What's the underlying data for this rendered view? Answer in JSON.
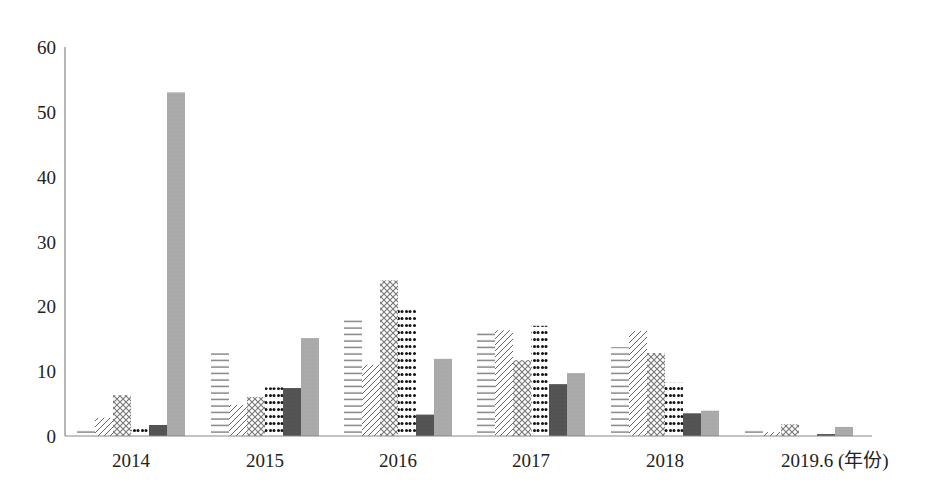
{
  "chart_data": {
    "type": "bar",
    "title": "",
    "xlabel": "(年份)",
    "ylabel": "",
    "ylim": [
      0,
      60
    ],
    "yticks": [
      0,
      10,
      20,
      30,
      40,
      50,
      60
    ],
    "grid": false,
    "legend_position": "bottom (cut off)",
    "categories": [
      "2014",
      "2015",
      "2016",
      "2017",
      "2018",
      "2019.6"
    ],
    "category_labels": [
      "2014",
      "2015",
      "2016",
      "2017",
      "2018",
      "2019.6 (年份)"
    ],
    "series": [
      {
        "name": "series-1",
        "pattern": "horizontal-lines",
        "values": [
          1.2,
          12.8,
          18.4,
          16.0,
          13.7,
          1.0
        ]
      },
      {
        "name": "series-2",
        "pattern": "diagonal-lines",
        "values": [
          2.8,
          4.8,
          11.0,
          16.3,
          16.2,
          0.6
        ]
      },
      {
        "name": "series-3",
        "pattern": "crosshatch",
        "values": [
          6.3,
          6.0,
          24.0,
          11.7,
          12.8,
          1.8
        ]
      },
      {
        "name": "series-4",
        "pattern": "dots",
        "values": [
          1.4,
          7.5,
          19.9,
          17.0,
          8.2,
          0.3
        ]
      },
      {
        "name": "series-5",
        "pattern": "solid-dark",
        "color": "#555555",
        "values": [
          1.7,
          7.4,
          3.3,
          8.0,
          3.5,
          0.3
        ]
      },
      {
        "name": "series-6",
        "pattern": "solid-gray",
        "color": "#aaaaaa",
        "values": [
          53.0,
          15.1,
          11.9,
          9.7,
          3.9,
          1.4
        ]
      }
    ]
  }
}
